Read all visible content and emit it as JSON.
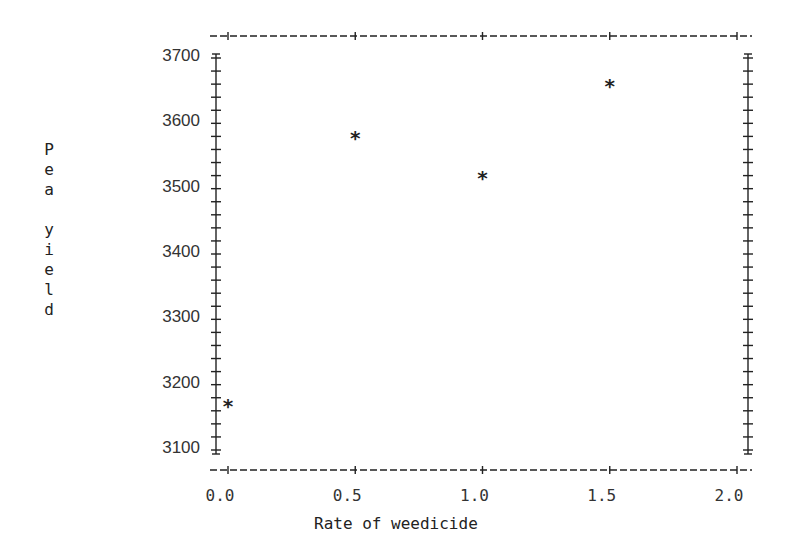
{
  "chart_data": {
    "type": "scatter",
    "title": "",
    "xlabel": "Rate of weedicide",
    "ylabel": "Pea yield",
    "xlim": [
      0.0,
      2.0
    ],
    "ylim": [
      3100,
      3700
    ],
    "x_ticks": [
      "0.0",
      "0.5",
      "1.0",
      "1.5",
      "2.0"
    ],
    "y_ticks": [
      "3100",
      "3200",
      "3300",
      "3400",
      "3500",
      "3600",
      "3700"
    ],
    "grid": false,
    "legend": null,
    "marker": "*",
    "x": [
      0.0,
      0.5,
      1.0,
      1.5
    ],
    "y": [
      3170,
      3580,
      3520,
      3660
    ]
  },
  "labels": {
    "ylabel_vertical": "P\ne\na\n\ny\ni\ne\nl\nd",
    "xlabel": "Rate of weedicide",
    "marker": "*"
  }
}
